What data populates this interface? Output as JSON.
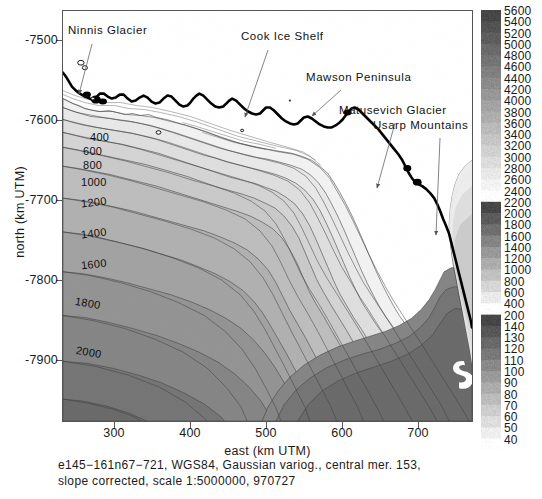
{
  "chart_data": {
    "type": "heatmap",
    "title": "",
    "xlabel": "east (km UTM)",
    "ylabel": "north (km UTM)",
    "xlim": [
      232,
      772
    ],
    "ylim": [
      -7942,
      -7462
    ],
    "xticks": [
      300,
      400,
      500,
      600,
      700
    ],
    "yticks": [
      -7500,
      -7600,
      -7700,
      -7800,
      -7900
    ],
    "xtick_labels": [
      "300",
      "400",
      "500",
      "600",
      "700"
    ],
    "ytick_labels": [
      "-7500",
      "-7600",
      "-7700",
      "-7800",
      "-7900"
    ],
    "grid": false,
    "legend_position": "right",
    "colorbar_label": "",
    "colorbar_levels": [
      5600,
      5400,
      5200,
      5000,
      4800,
      4600,
      4400,
      4200,
      4000,
      3800,
      3600,
      3400,
      3200,
      3000,
      2800,
      2600,
      2400,
      2200,
      2000,
      1800,
      1600,
      1400,
      1200,
      1000,
      800,
      600,
      400,
      200,
      140,
      130,
      120,
      110,
      100,
      90,
      80,
      70,
      60,
      50,
      40
    ],
    "contour_labels": [
      {
        "value": "400",
        "x": 90,
        "y": 137
      },
      {
        "value": "600",
        "x": 83,
        "y": 151
      },
      {
        "value": "800",
        "x": 83,
        "y": 165
      },
      {
        "value": "1000",
        "x": 83,
        "y": 182
      },
      {
        "value": "1200",
        "x": 84,
        "y": 201
      },
      {
        "value": "1400",
        "x": 84,
        "y": 232
      },
      {
        "value": "1600",
        "x": 84,
        "y": 263
      },
      {
        "value": "1800",
        "x": 78,
        "y": 302
      },
      {
        "value": "2000",
        "x": 80,
        "y": 351
      }
    ],
    "annotations": [
      {
        "label": "Ninnis Glacier",
        "x": 68,
        "y": 30
      },
      {
        "label": "Cook Ice Shelf",
        "x": 242,
        "y": 36
      },
      {
        "label": "Mawson Peninsula",
        "x": 307,
        "y": 77
      },
      {
        "label": "Matusevich Glacier",
        "x": 340,
        "y": 110
      },
      {
        "label": "Usarp Mountains",
        "x": 374,
        "y": 125
      }
    ],
    "caption_lines": [
      "e145−161n67−721, WGS84, Gaussian variog., central mer. 153,",
      "slope corrected, scale 1:5000000, 970727"
    ]
  },
  "figure": {
    "axis_title_x": "east (km UTM)",
    "axis_title_y": "north (km UTM)",
    "caption_line_1": "e145−161n67−721, WGS84, Gaussian variog., central mer. 153,",
    "caption_line_2": "slope corrected, scale 1:5000000, 970727"
  },
  "colors": {
    "frame": "#555555",
    "text": "#111111",
    "background": "#ffffff",
    "coastline": "#000000",
    "contour_line": "#3a3a3a"
  }
}
